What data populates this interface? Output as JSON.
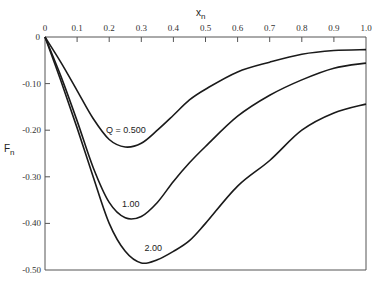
{
  "chart_data": {
    "type": "line",
    "title": "",
    "xlabel": "x_n",
    "ylabel": "F_n",
    "xlim": [
      0,
      1.0
    ],
    "ylim": [
      -0.5,
      0
    ],
    "grid": false,
    "legend": "inline curve labels",
    "x_ticks": [
      "0",
      "0.1",
      "0.2",
      "0.3",
      "0.4",
      "0.5",
      "0.6",
      "0.7",
      "0.8",
      "0.9",
      "1.0"
    ],
    "y_ticks": [
      "0",
      "-0.10",
      "-0.20",
      "-0.30",
      "-0.40",
      "-0.50"
    ],
    "x": [
      0,
      0.05,
      0.1,
      0.15,
      0.2,
      0.25,
      0.3,
      0.35,
      0.4,
      0.45,
      0.5,
      0.6,
      0.7,
      0.8,
      0.9,
      1.0
    ],
    "series": [
      {
        "name": "Q = 0.500",
        "label": "Q = 0.500",
        "values": [
          0,
          -0.055,
          -0.115,
          -0.175,
          -0.22,
          -0.236,
          -0.228,
          -0.2,
          -0.168,
          -0.135,
          -0.112,
          -0.075,
          -0.054,
          -0.037,
          -0.029,
          -0.027
        ]
      },
      {
        "name": "1.00",
        "label": "1.00",
        "values": [
          0,
          -0.085,
          -0.18,
          -0.28,
          -0.355,
          -0.388,
          -0.385,
          -0.355,
          -0.31,
          -0.27,
          -0.235,
          -0.17,
          -0.125,
          -0.092,
          -0.067,
          -0.056
        ]
      },
      {
        "name": "2.00",
        "label": "2.00",
        "values": [
          0,
          -0.095,
          -0.195,
          -0.3,
          -0.4,
          -0.46,
          -0.485,
          -0.478,
          -0.46,
          -0.437,
          -0.4,
          -0.32,
          -0.265,
          -0.2,
          -0.163,
          -0.144
        ]
      }
    ],
    "annotations": [
      {
        "text": "Q = 0.500",
        "x": 0.19,
        "y": -0.205
      },
      {
        "text": "1.00",
        "x": 0.24,
        "y": -0.365
      },
      {
        "text": "2.00",
        "x": 0.31,
        "y": -0.46
      }
    ]
  },
  "labels": {
    "x_axis_title": "x",
    "x_axis_sub": "n",
    "y_axis_title": "F",
    "y_axis_sub": "n"
  },
  "style": {
    "line_color": "#1a1a1a",
    "axis_color": "#555555"
  }
}
